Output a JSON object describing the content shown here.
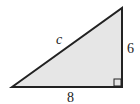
{
  "diagram": {
    "type": "right-triangle",
    "colors": {
      "fill": "#e6e6e6",
      "stroke": "#222222",
      "background": "#ffffff"
    },
    "sides": {
      "hypotenuse": {
        "label": "c"
      },
      "vertical_leg": {
        "label": "6"
      },
      "horizontal_leg": {
        "label": "8"
      }
    },
    "right_angle_marker": true
  }
}
